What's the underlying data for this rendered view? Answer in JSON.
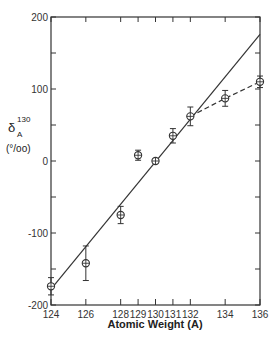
{
  "chart_data": {
    "type": "scatter",
    "title": "",
    "xlabel": "Atomic Weight (A)",
    "ylabel": "δ_A^130 (‰)",
    "ylabel_parts": {
      "symbol": "δ",
      "sub": "A",
      "sup": "130",
      "units": "(°/oo)"
    },
    "xlim": [
      124,
      136
    ],
    "ylim": [
      -200,
      200
    ],
    "grid": false,
    "legend": null,
    "x_ticks": [
      124,
      126,
      128,
      129,
      130,
      131,
      132,
      134,
      136
    ],
    "x_tick_labels": [
      "124",
      "126",
      "128",
      "129",
      "130",
      "131",
      "132",
      "134",
      "136"
    ],
    "y_ticks": [
      -200,
      -150,
      -100,
      -50,
      0,
      50,
      100,
      150,
      200
    ],
    "y_tick_labels": [
      "-200",
      "",
      "-100",
      "",
      "0",
      "",
      "100",
      "",
      "200"
    ],
    "series": [
      {
        "name": "measured",
        "marker": "circle-plus",
        "x": [
          124,
          126,
          128,
          129,
          130,
          131,
          132,
          134,
          136
        ],
        "y": [
          -174,
          -142,
          -75,
          8,
          0,
          35,
          62,
          87,
          110
        ],
        "yerr": [
          12,
          24,
          12,
          7,
          3,
          10,
          13,
          11,
          8
        ]
      },
      {
        "name": "linear fit",
        "style": "solid",
        "x": [
          124,
          136
        ],
        "y": [
          -178,
          176
        ]
      },
      {
        "name": "curve (heavy isotopes)",
        "style": "dashed",
        "x": [
          132,
          134,
          136
        ],
        "y": [
          62,
          87,
          110
        ]
      }
    ]
  }
}
